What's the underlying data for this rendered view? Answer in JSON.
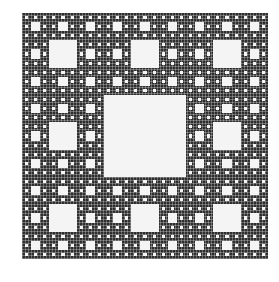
{
  "figure": {
    "levels_rendered": 4,
    "colors": {
      "fill": "#2e2e2e",
      "hole": "#f4f4f4",
      "background": "#ffffff"
    }
  }
}
